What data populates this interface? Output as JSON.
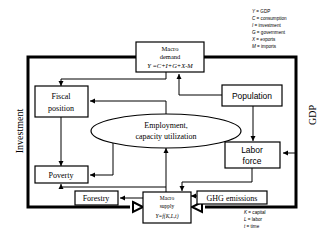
{
  "legend_top": [
    {
      "symbol": "Y",
      "meaning": "GDP"
    },
    {
      "symbol": "C",
      "meaning": "consumption"
    },
    {
      "symbol": "I",
      "meaning": "investment"
    },
    {
      "symbol": "G",
      "meaning": "government"
    },
    {
      "symbol": "X",
      "meaning": "exports"
    },
    {
      "symbol": "M",
      "meaning": "imports"
    }
  ],
  "legend_bottom": [
    {
      "symbol": "K",
      "meaning": "capital"
    },
    {
      "symbol": "L",
      "meaning": "labor"
    },
    {
      "symbol": "t",
      "meaning": "time"
    }
  ],
  "nodes": {
    "macro_demand": {
      "line1": "Macro",
      "line2": "demand",
      "formula": "Y =C+I+G+X-M"
    },
    "fiscal_position": {
      "line1": "Fiscal",
      "line2": "position"
    },
    "population": {
      "label": "Population"
    },
    "employment": {
      "line1": "Employment,",
      "line2": "capacity utilization"
    },
    "labor_force": {
      "line1": "Labor",
      "line2": "force"
    },
    "poverty": {
      "label": "Poverty"
    },
    "forestry": {
      "label": "Forestry"
    },
    "macro_supply": {
      "line1": "Macro",
      "line2": "supply",
      "formula": "Y=f(K,L,t)"
    },
    "ghg_emissions": {
      "label": "GHG emissions"
    }
  },
  "side_labels": {
    "left": "Investment",
    "right": "GDP"
  }
}
